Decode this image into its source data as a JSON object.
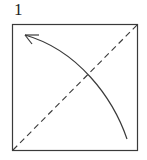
{
  "diagram": {
    "type": "origami-step",
    "step_number": "1",
    "elements": [
      {
        "kind": "square-paper",
        "label": "paper"
      },
      {
        "kind": "valley-fold-line",
        "from": "bottom-left corner",
        "to": "top-right corner",
        "style": "dashed"
      },
      {
        "kind": "fold-arrow",
        "from": "bottom-right area",
        "to": "top-left corner",
        "style": "curved"
      }
    ],
    "colors": {
      "line": "#3a3a3a",
      "background": "#ffffff"
    }
  }
}
